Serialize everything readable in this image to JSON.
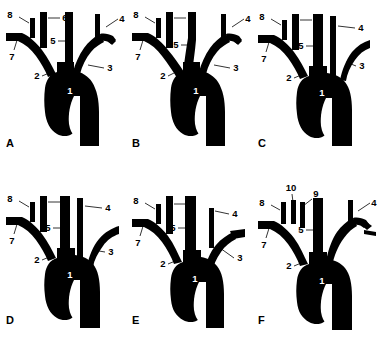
{
  "figure": {
    "background_color": "#ffffff",
    "vessel_color": "#000000",
    "label_color": "#000000",
    "inner_label_color": "#ffffff",
    "panel_count": 6,
    "columns": 3,
    "rows": 2
  },
  "panels": [
    {
      "id": "A",
      "letter": "A",
      "labels": [
        {
          "key": "1",
          "text": "1",
          "style": "inner"
        },
        {
          "key": "2",
          "text": "2",
          "style": "outer"
        },
        {
          "key": "3",
          "text": "3",
          "style": "outer"
        },
        {
          "key": "4",
          "text": "4",
          "style": "outer"
        },
        {
          "key": "5",
          "text": "5",
          "style": "outer"
        },
        {
          "key": "6",
          "text": "6",
          "style": "outer"
        },
        {
          "key": "7",
          "text": "7",
          "style": "outer"
        },
        {
          "key": "8",
          "text": "8",
          "style": "outer"
        }
      ]
    },
    {
      "id": "B",
      "letter": "B",
      "labels": [
        {
          "key": "1",
          "text": "1",
          "style": "inner"
        },
        {
          "key": "2",
          "text": "2",
          "style": "outer"
        },
        {
          "key": "3",
          "text": "3",
          "style": "outer"
        },
        {
          "key": "4",
          "text": "4",
          "style": "outer"
        },
        {
          "key": "5",
          "text": "5",
          "style": "outer"
        },
        {
          "key": "6",
          "text": "6",
          "style": "outer"
        },
        {
          "key": "7",
          "text": "7",
          "style": "outer"
        },
        {
          "key": "8",
          "text": "8",
          "style": "outer"
        }
      ]
    },
    {
      "id": "C",
      "letter": "C",
      "labels": [
        {
          "key": "1",
          "text": "1",
          "style": "inner"
        },
        {
          "key": "2",
          "text": "2",
          "style": "outer"
        },
        {
          "key": "3",
          "text": "3",
          "style": "outer"
        },
        {
          "key": "4",
          "text": "4",
          "style": "outer"
        },
        {
          "key": "5",
          "text": "5",
          "style": "outer"
        },
        {
          "key": "6",
          "text": "6",
          "style": "outer"
        },
        {
          "key": "7",
          "text": "7",
          "style": "outer"
        },
        {
          "key": "8",
          "text": "8",
          "style": "outer"
        }
      ]
    },
    {
      "id": "D",
      "letter": "D",
      "labels": [
        {
          "key": "1",
          "text": "1",
          "style": "inner"
        },
        {
          "key": "2",
          "text": "2",
          "style": "outer"
        },
        {
          "key": "3",
          "text": "3",
          "style": "outer"
        },
        {
          "key": "4",
          "text": "4",
          "style": "outer"
        },
        {
          "key": "5",
          "text": "5",
          "style": "outer"
        },
        {
          "key": "6",
          "text": "6",
          "style": "outer"
        },
        {
          "key": "7",
          "text": "7",
          "style": "outer"
        },
        {
          "key": "8",
          "text": "8",
          "style": "outer"
        }
      ]
    },
    {
      "id": "E",
      "letter": "E",
      "labels": [
        {
          "key": "1",
          "text": "1",
          "style": "inner"
        },
        {
          "key": "2",
          "text": "2",
          "style": "outer"
        },
        {
          "key": "3",
          "text": "3",
          "style": "outer"
        },
        {
          "key": "4",
          "text": "4",
          "style": "outer"
        },
        {
          "key": "5",
          "text": "5",
          "style": "outer"
        },
        {
          "key": "6",
          "text": "6",
          "style": "outer"
        },
        {
          "key": "7",
          "text": "7",
          "style": "outer"
        },
        {
          "key": "8",
          "text": "8",
          "style": "outer"
        }
      ]
    },
    {
      "id": "F",
      "letter": "F",
      "labels": [
        {
          "key": "1",
          "text": "1",
          "style": "inner"
        },
        {
          "key": "2",
          "text": "2",
          "style": "outer"
        },
        {
          "key": "4",
          "text": "4",
          "style": "outer"
        },
        {
          "key": "5",
          "text": "5",
          "style": "outer"
        },
        {
          "key": "7",
          "text": "7",
          "style": "outer"
        },
        {
          "key": "8",
          "text": "8",
          "style": "outer"
        },
        {
          "key": "9",
          "text": "9",
          "style": "outer"
        },
        {
          "key": "10",
          "text": "10",
          "style": "outer"
        }
      ]
    }
  ],
  "labels_text": {
    "a": {
      "n1": "1",
      "n2": "2",
      "n3": "3",
      "n4": "4",
      "n5": "5",
      "n6": "6",
      "n7": "7",
      "n8": "8"
    },
    "b": {
      "n1": "1",
      "n2": "2",
      "n3": "3",
      "n4": "4",
      "n5": "5",
      "n6": "6",
      "n7": "7",
      "n8": "8"
    },
    "c": {
      "n1": "1",
      "n2": "2",
      "n3": "3",
      "n4": "4",
      "n5": "5",
      "n6": "6",
      "n7": "7",
      "n8": "8"
    },
    "d": {
      "n1": "1",
      "n2": "2",
      "n3": "3",
      "n4": "4",
      "n5": "5",
      "n6": "6",
      "n7": "7",
      "n8": "8"
    },
    "e": {
      "n1": "1",
      "n2": "2",
      "n3": "3",
      "n4": "4",
      "n5": "5",
      "n6": "6",
      "n7": "7",
      "n8": "8"
    },
    "f": {
      "n1": "1",
      "n2": "2",
      "n4": "4",
      "n5": "5",
      "n7": "7",
      "n8": "8",
      "n9": "9",
      "n10": "10"
    }
  },
  "panel_letters": {
    "a": "A",
    "b": "B",
    "c": "C",
    "d": "D",
    "e": "E",
    "f": "F"
  }
}
